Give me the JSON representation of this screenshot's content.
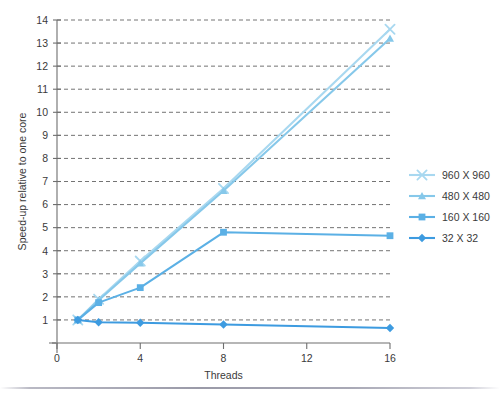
{
  "chart_data": {
    "type": "line",
    "title": "",
    "xlabel": "Threads",
    "ylabel": "Speed-up relative to one core",
    "xlim": [
      0,
      16
    ],
    "ylim": [
      0,
      14
    ],
    "xticks": [
      0,
      4,
      8,
      12,
      16
    ],
    "xtick_labels": [
      "0",
      "4",
      "8",
      "12",
      "16"
    ],
    "yticks": [
      1,
      2,
      3,
      4,
      5,
      6,
      7,
      8,
      9,
      10,
      11,
      12,
      13,
      14
    ],
    "ytick_labels": [
      "1",
      "2",
      "3",
      "4",
      "5",
      "6",
      "7",
      "8",
      "9",
      "10",
      "11",
      "12",
      "13",
      "14"
    ],
    "grid": true,
    "grid_axis": "y",
    "legend_position": "right",
    "x": [
      1,
      2,
      4,
      8,
      16
    ],
    "series": [
      {
        "name": "960 X 960",
        "label": "960 X 960",
        "color": "#A8D8F0",
        "marker": "x",
        "values": [
          1.0,
          1.9,
          3.55,
          6.7,
          13.6
        ]
      },
      {
        "name": "480 X 480",
        "label": "480 X 480",
        "color": "#86C8EA",
        "marker": "triangle",
        "values": [
          1.0,
          1.85,
          3.45,
          6.6,
          13.2
        ]
      },
      {
        "name": "160 X 160",
        "label": "160 X 160",
        "color": "#5BB0E5",
        "marker": "square",
        "values": [
          1.0,
          1.75,
          2.4,
          4.8,
          4.65
        ]
      },
      {
        "name": "32 X 32",
        "label": "32 X 32",
        "color": "#3D9BE0",
        "marker": "diamond",
        "values": [
          1.0,
          0.9,
          0.88,
          0.8,
          0.65
        ]
      }
    ]
  },
  "legend": {
    "entries": [
      {
        "label": "960 X 960"
      },
      {
        "label": "480 X 480"
      },
      {
        "label": "160 X 160"
      },
      {
        "label": "32 X 32"
      }
    ]
  },
  "axes": {
    "x_title": "Threads",
    "y_title": "Speed-up relative to one core"
  }
}
